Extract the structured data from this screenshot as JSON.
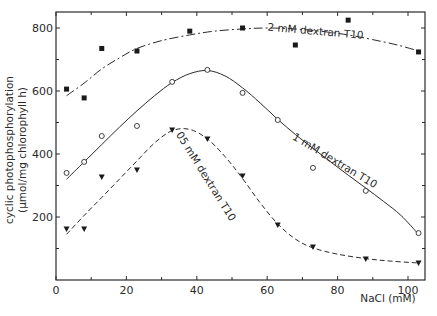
{
  "chart_data": {
    "type": "scatter",
    "title": "",
    "xlabel": "NaCl (mM)",
    "ylabel_line1": "cyclic photophosphorylation",
    "ylabel_line2": "(µmol/mg chlorophyll h)",
    "xlim": [
      0,
      105
    ],
    "ylim": [
      0,
      845
    ],
    "x_ticks": [
      0,
      20,
      40,
      60,
      80,
      100
    ],
    "x_minor_ticks": [
      10,
      30,
      50,
      70,
      90
    ],
    "y_ticks": [
      200,
      400,
      600,
      800
    ],
    "y_minor_ticks": [
      100,
      300,
      500,
      700
    ],
    "grid": false,
    "legend": "inline curve labels",
    "series": [
      {
        "name": "2 mM dextran T10",
        "marker": "square-filled",
        "line": "dash-dot",
        "points": [
          [
            3,
            606
          ],
          [
            8,
            578
          ],
          [
            13,
            735
          ],
          [
            23,
            727
          ],
          [
            38,
            790
          ],
          [
            53,
            800
          ],
          [
            68,
            746
          ],
          [
            83,
            825
          ],
          [
            103,
            724
          ]
        ],
        "fit": [
          [
            3,
            585
          ],
          [
            8,
            625
          ],
          [
            13,
            670
          ],
          [
            18,
            705
          ],
          [
            23,
            735
          ],
          [
            30,
            760
          ],
          [
            38,
            778
          ],
          [
            45,
            790
          ],
          [
            53,
            797
          ],
          [
            60,
            800
          ],
          [
            68,
            797
          ],
          [
            75,
            790
          ],
          [
            83,
            778
          ],
          [
            90,
            763
          ],
          [
            97,
            746
          ],
          [
            103,
            727
          ]
        ],
        "label": {
          "text": "2 mM dextran T10",
          "x": 60,
          "y": 792,
          "angle": 5
        }
      },
      {
        "name": "1 mM dextran T10",
        "marker": "circle-open",
        "line": "solid",
        "points": [
          [
            3,
            340
          ],
          [
            8,
            375
          ],
          [
            13,
            457
          ],
          [
            23,
            489
          ],
          [
            33,
            629
          ],
          [
            43,
            667
          ],
          [
            53,
            594
          ],
          [
            63,
            508
          ],
          [
            73,
            356
          ],
          [
            88,
            283
          ],
          [
            103,
            149
          ]
        ],
        "fit": [
          [
            3,
            320
          ],
          [
            8,
            375
          ],
          [
            13,
            430
          ],
          [
            18,
            485
          ],
          [
            23,
            537
          ],
          [
            28,
            585
          ],
          [
            33,
            627
          ],
          [
            38,
            655
          ],
          [
            43,
            665
          ],
          [
            48,
            648
          ],
          [
            53,
            610
          ],
          [
            58,
            562
          ],
          [
            63,
            510
          ],
          [
            68,
            462
          ],
          [
            73,
            418
          ],
          [
            78,
            375
          ],
          [
            83,
            333
          ],
          [
            88,
            292
          ],
          [
            93,
            250
          ],
          [
            98,
            205
          ],
          [
            103,
            145
          ]
        ],
        "label": {
          "text": "1 mM dextran T10",
          "x": 67,
          "y": 448,
          "angle": 31
        }
      },
      {
        "name": "0.5 mM dextran T10",
        "marker": "triangle-down-filled",
        "line": "dashed",
        "points": [
          [
            3,
            162
          ],
          [
            8,
            162
          ],
          [
            13,
            327
          ],
          [
            23,
            349
          ],
          [
            33,
            476
          ],
          [
            43,
            448
          ],
          [
            53,
            330
          ],
          [
            63,
            175
          ],
          [
            73,
            105
          ],
          [
            88,
            67
          ],
          [
            103,
            54
          ]
        ],
        "fit": [
          [
            3,
            145
          ],
          [
            8,
            205
          ],
          [
            13,
            262
          ],
          [
            18,
            320
          ],
          [
            23,
            378
          ],
          [
            28,
            435
          ],
          [
            33,
            474
          ],
          [
            38,
            478
          ],
          [
            43,
            448
          ],
          [
            48,
            392
          ],
          [
            53,
            322
          ],
          [
            58,
            245
          ],
          [
            63,
            178
          ],
          [
            68,
            130
          ],
          [
            73,
            102
          ],
          [
            80,
            82
          ],
          [
            88,
            68
          ],
          [
            95,
            60
          ],
          [
            103,
            54
          ]
        ],
        "label": {
          "text": "05 mM dextran T10",
          "x": 34,
          "y": 462,
          "angle": 58
        }
      }
    ]
  }
}
